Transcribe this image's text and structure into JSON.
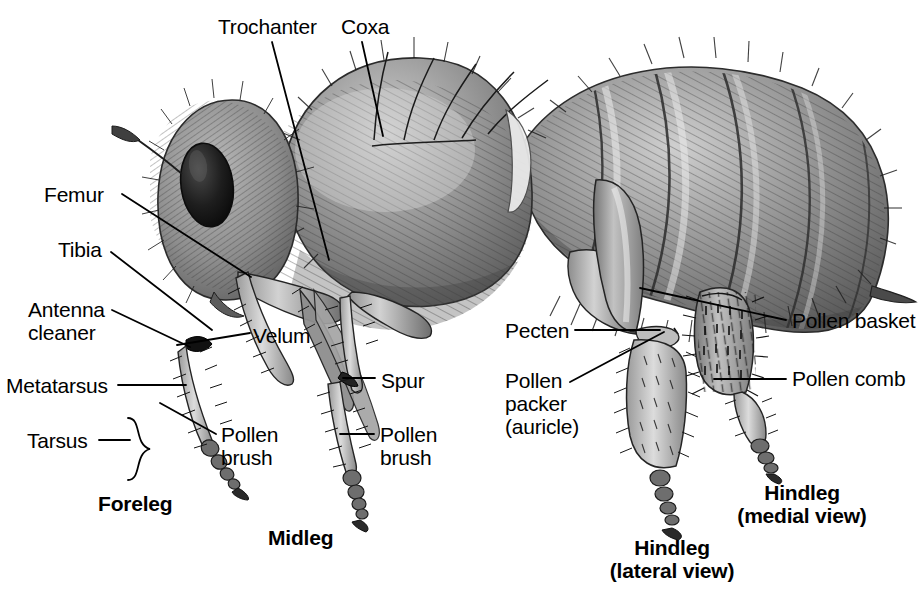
{
  "figure": {
    "view": "lateral",
    "style": "grayscale pencil illustration",
    "background_color": "#ffffff",
    "ink_color": "#000000"
  },
  "labels": [
    {
      "id": "trochanter",
      "text": "Trochanter",
      "x": 218,
      "y": 15,
      "align": "left",
      "bold": false
    },
    {
      "id": "coxa",
      "text": "Coxa",
      "x": 341,
      "y": 15,
      "align": "left",
      "bold": false
    },
    {
      "id": "femur",
      "text": "Femur",
      "x": 44,
      "y": 183,
      "align": "left",
      "bold": false
    },
    {
      "id": "tibia",
      "text": "Tibia",
      "x": 58,
      "y": 238,
      "align": "left",
      "bold": false
    },
    {
      "id": "antenna-cleaner",
      "text": "Antenna\ncleaner",
      "x": 28,
      "y": 298,
      "align": "left",
      "bold": false
    },
    {
      "id": "velum",
      "text": "Velum",
      "x": 253,
      "y": 324,
      "align": "left",
      "bold": false
    },
    {
      "id": "metatarsus",
      "text": "Metatarsus",
      "x": 6,
      "y": 374,
      "align": "left",
      "bold": false
    },
    {
      "id": "spur",
      "text": "Spur",
      "x": 381,
      "y": 369,
      "align": "left",
      "bold": false
    },
    {
      "id": "tarsus",
      "text": "Tarsus",
      "x": 27,
      "y": 429,
      "align": "left",
      "bold": false
    },
    {
      "id": "pollen-brush-foreleg",
      "text": "Pollen\nbrush",
      "x": 221,
      "y": 423,
      "align": "left",
      "bold": false
    },
    {
      "id": "pollen-brush-midleg",
      "text": "Pollen\nbrush",
      "x": 380,
      "y": 423,
      "align": "left",
      "bold": false
    },
    {
      "id": "pecten",
      "text": "Pecten",
      "x": 505,
      "y": 319,
      "align": "left",
      "bold": false
    },
    {
      "id": "pollen-packer",
      "text": "Pollen\npacker\n(auricle)",
      "x": 505,
      "y": 369,
      "align": "left",
      "bold": false
    },
    {
      "id": "pollen-basket",
      "text": "Pollen basket",
      "x": 792,
      "y": 309,
      "align": "left",
      "bold": false
    },
    {
      "id": "pollen-comb",
      "text": "Pollen comb",
      "x": 792,
      "y": 367,
      "align": "left",
      "bold": false
    }
  ],
  "captions": [
    {
      "id": "foreleg",
      "text": "Foreleg",
      "x": 98,
      "y": 492,
      "bold": true
    },
    {
      "id": "midleg",
      "text": "Midleg",
      "x": 268,
      "y": 526,
      "bold": true
    },
    {
      "id": "hindleg-lateral",
      "text": "Hindleg\n(lateral view)",
      "x": 582,
      "y": 536,
      "bold": true,
      "align": "center",
      "width": 180
    },
    {
      "id": "hindleg-medial",
      "text": "Hindleg\n(medial view)",
      "x": 712,
      "y": 481,
      "bold": true,
      "align": "center",
      "width": 180
    }
  ],
  "leader_lines": [
    {
      "id": "leader-trochanter",
      "points": "272,42 329,260"
    },
    {
      "id": "leader-coxa",
      "points": "362,42 383,136"
    },
    {
      "id": "leader-femur",
      "points": "122,194 251,277"
    },
    {
      "id": "leader-tibia",
      "points": "111,252 212,330"
    },
    {
      "id": "leader-antenna-cleaner",
      "points": "112,310 190,347"
    },
    {
      "id": "leader-velum",
      "points": "177,345 250,333"
    },
    {
      "id": "leader-metatarsus",
      "points": "118,385 186,385"
    },
    {
      "id": "leader-spur",
      "points": "343,378 375,378"
    },
    {
      "id": "leader-tarsus",
      "points": "99,440 130,440"
    },
    {
      "id": "leader-pollen-brush-foreleg",
      "points": "160,403 216,434"
    },
    {
      "id": "leader-pollen-brush-midleg",
      "points": "340,434 374,434"
    },
    {
      "id": "leader-pecten",
      "points": "575,330 660,330"
    },
    {
      "id": "leader-pollen-packer",
      "points": "570,382 664,332"
    },
    {
      "id": "leader-pollen-basket",
      "points": "640,288 786,320"
    },
    {
      "id": "leader-pollen-comb",
      "points": "714,379 786,379"
    }
  ],
  "tarsus_brace": {
    "id": "tarsus-brace",
    "x": 128,
    "y": 418,
    "height": 62
  }
}
